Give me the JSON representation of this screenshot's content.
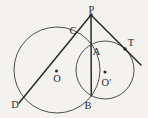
{
  "figure": {
    "background_color": "#f3f2ef",
    "line_color": "#2a2a2a",
    "circle_stroke_color": "#3c3c3c",
    "label_color": "#2b2b2b",
    "width": 148,
    "height": 118,
    "circles": [
      {
        "id": "large-circle",
        "cx": 57,
        "cy": 70,
        "r": 43,
        "stroke_width": 0.9
      },
      {
        "id": "small-circle",
        "cx": 105,
        "cy": 70,
        "r": 29,
        "stroke_width": 0.9
      }
    ],
    "lines": [
      {
        "id": "secant-line-PCD",
        "x1": 91,
        "y1": 15,
        "x2": 19,
        "y2": 103,
        "stroke_width": 1.5
      },
      {
        "id": "chord-line-PAB",
        "x1": 91,
        "y1": 15,
        "x2": 91.3,
        "y2": 96,
        "stroke_width": 1.5
      },
      {
        "id": "tangent-line-PT",
        "x1": 91,
        "y1": 15,
        "x2": 141,
        "y2": 65,
        "stroke_width": 1.5
      }
    ],
    "points": [
      {
        "id": "point-dot-P",
        "x": 91,
        "y": 15,
        "r": 1.7
      },
      {
        "id": "tangent-point-dot-T",
        "x": 125,
        "y": 49,
        "r": 1.7
      },
      {
        "id": "center-dot-O",
        "x": 56.5,
        "y": 71,
        "r": 1.5
      },
      {
        "id": "center-dot-O-prime",
        "x": 105,
        "y": 72,
        "r": 1.5
      }
    ],
    "labels": [
      {
        "id": "label-P",
        "text": "P",
        "x": 91.5,
        "y": 12.5
      },
      {
        "id": "label-C",
        "text": "C",
        "x": 73,
        "y": 34
      },
      {
        "id": "label-T",
        "text": "T",
        "x": 131,
        "y": 46
      },
      {
        "id": "label-A",
        "text": "A",
        "x": 96.5,
        "y": 55
      },
      {
        "id": "label-O",
        "text": "O",
        "x": 57,
        "y": 82
      },
      {
        "id": "label-O-prime",
        "text": "O′",
        "x": 106.5,
        "y": 86
      },
      {
        "id": "label-B",
        "text": "B",
        "x": 88,
        "y": 108.5
      },
      {
        "id": "label-D",
        "text": "D",
        "x": 15,
        "y": 107.5
      }
    ]
  }
}
